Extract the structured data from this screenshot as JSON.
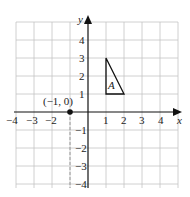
{
  "diagram": {
    "type": "coordinate-grid",
    "x_axis": {
      "label": "x",
      "min": -4,
      "max": 4,
      "ticks": [
        "−4",
        "−3",
        "−2",
        "1",
        "2",
        "3",
        "4"
      ]
    },
    "y_axis": {
      "label": "y",
      "min": -4,
      "max": 4,
      "ticks": [
        "4",
        "3",
        "2",
        "1",
        "−1",
        "−2",
        "−3",
        "−4"
      ]
    },
    "shape": {
      "name": "A",
      "vertices": [
        [
          1,
          1
        ],
        [
          1,
          3
        ],
        [
          2,
          1
        ]
      ]
    },
    "point": {
      "label": "(−1, 0)",
      "x": -1,
      "y": 0
    },
    "colors": {
      "grid": "#b8b8b8",
      "axes": "#111111",
      "shape": "#111111"
    }
  }
}
